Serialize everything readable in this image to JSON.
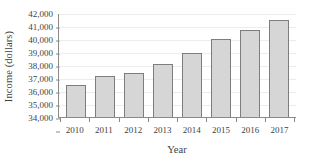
{
  "chart_data": {
    "type": "bar",
    "title": "",
    "xlabel": "Year",
    "ylabel": "Income (dollars)",
    "categories": [
      "2010",
      "2011",
      "2012",
      "2013",
      "2014",
      "2015",
      "2016",
      "2017"
    ],
    "values": [
      36500,
      37150,
      37400,
      38100,
      38950,
      40000,
      40700,
      41500
    ],
    "ylim": [
      34000,
      42000
    ],
    "ytick_values": [
      34000,
      35000,
      36000,
      37000,
      38000,
      39000,
      40000,
      41000,
      42000
    ],
    "ytick_labels": [
      "34,000",
      "35,000",
      "36,000",
      "37,000",
      "38,000",
      "39,000",
      "40,000",
      "41,000",
      "42,000"
    ],
    "grid": true,
    "legend": "none",
    "bar_fill_color": "#d6d6d6",
    "bar_border_color": "#7d7d7d",
    "gridline_color": "#ececec",
    "axis_color": "#8a8a8a"
  }
}
